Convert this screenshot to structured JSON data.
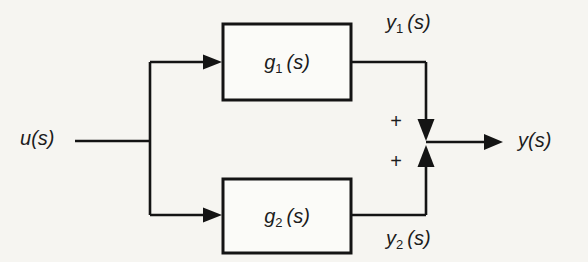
{
  "diagram": {
    "colors": {
      "background": "#f6f5f1",
      "line": "#141414",
      "text": "#1c1c1c"
    },
    "input": {
      "base": "u",
      "arg": "(s)"
    },
    "output": {
      "base": "y",
      "arg": "(s)"
    },
    "blocks": [
      {
        "base": "g",
        "sub": "1",
        "arg": "(s)"
      },
      {
        "base": "g",
        "sub": "2",
        "arg": "(s)"
      }
    ],
    "branch_signals": [
      {
        "base": "y",
        "sub": "1",
        "arg": "(s)"
      },
      {
        "base": "y",
        "sub": "2",
        "arg": "(s)"
      }
    ],
    "summing": {
      "top_sign": "+",
      "bottom_sign": "+"
    }
  }
}
